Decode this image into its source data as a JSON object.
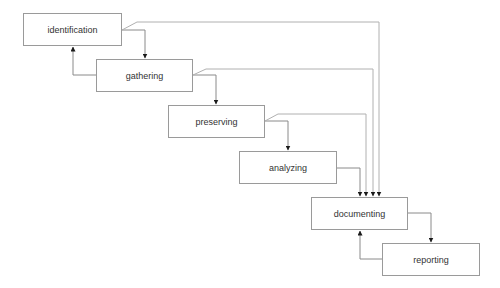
{
  "diagram": {
    "type": "waterfall-process-flow",
    "colors": {
      "box_border": "#9a9a9a",
      "line": "#8a8a8a",
      "text": "#333333",
      "arrow": "#1a1a1a"
    },
    "nodes": [
      {
        "id": "identification",
        "label": "identification",
        "x": 23,
        "y": 13,
        "w": 99,
        "h": 33
      },
      {
        "id": "gathering",
        "label": "gathering",
        "x": 96,
        "y": 59,
        "w": 97,
        "h": 33
      },
      {
        "id": "preserving",
        "label": "preserving",
        "x": 168,
        "y": 105,
        "w": 97,
        "h": 33
      },
      {
        "id": "analyzing",
        "label": "analyzing",
        "x": 239,
        "y": 151,
        "w": 98,
        "h": 33
      },
      {
        "id": "documenting",
        "label": "documenting",
        "x": 311,
        "y": 197,
        "w": 97,
        "h": 33
      },
      {
        "id": "reporting",
        "label": "reporting",
        "x": 382,
        "y": 243,
        "w": 98,
        "h": 33
      }
    ],
    "edges": [
      {
        "from": "identification",
        "to": "gathering",
        "kind": "forward"
      },
      {
        "from": "gathering",
        "to": "identification",
        "kind": "back"
      },
      {
        "from": "gathering",
        "to": "preserving",
        "kind": "forward"
      },
      {
        "from": "preserving",
        "to": "analyzing",
        "kind": "forward"
      },
      {
        "from": "analyzing",
        "to": "documenting",
        "kind": "forward"
      },
      {
        "from": "identification",
        "to": "documenting",
        "kind": "bypass"
      },
      {
        "from": "gathering",
        "to": "documenting",
        "kind": "bypass"
      },
      {
        "from": "preserving",
        "to": "documenting",
        "kind": "bypass"
      },
      {
        "from": "documenting",
        "to": "reporting",
        "kind": "forward"
      },
      {
        "from": "reporting",
        "to": "documenting",
        "kind": "back"
      }
    ]
  }
}
